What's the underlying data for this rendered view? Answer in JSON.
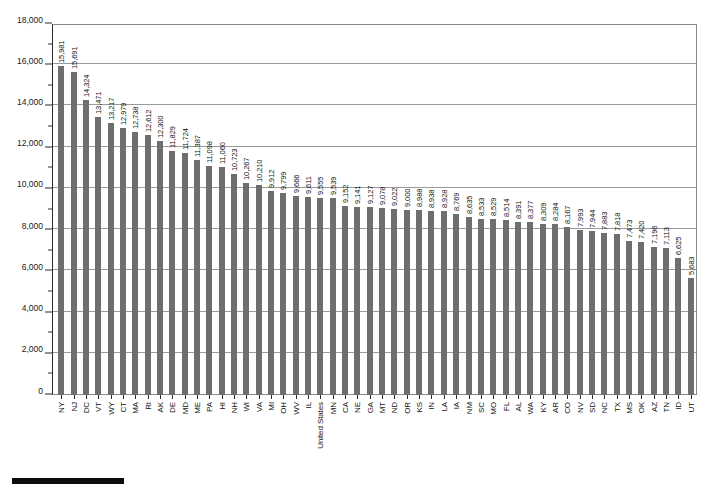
{
  "chart_data": {
    "type": "bar",
    "title": "",
    "subtitle": "",
    "xlabel": "",
    "ylabel": "",
    "ylim": [
      0,
      18000
    ],
    "ytick_step": 2000,
    "yminor_step": 1000,
    "grid": true,
    "legend_position": "bottom-left",
    "orientation": "vertical",
    "bar_color": "#6e6e6e",
    "value_labels_shown": true,
    "ytick_labels": [
      "0",
      "2,000",
      "4,000",
      "6,000",
      "8,000",
      "10,000",
      "12,000",
      "14,000",
      "16,000",
      "18,000"
    ],
    "ytick_values": [
      0,
      2000,
      4000,
      6000,
      8000,
      10000,
      12000,
      14000,
      16000,
      18000
    ],
    "categories": [
      "NY",
      "NJ",
      "DC",
      "VT",
      "WY",
      "CT",
      "MA",
      "RI",
      "AK",
      "DE",
      "MD",
      "ME",
      "PA",
      "HI",
      "NH",
      "WI",
      "VA",
      "MI",
      "OH",
      "WV",
      "IL",
      "United States",
      "MN",
      "CA",
      "NE",
      "GA",
      "MT",
      "ND",
      "OR",
      "KS",
      "IN",
      "LA",
      "IA",
      "NM",
      "SC",
      "MO",
      "FL",
      "AL",
      "WA",
      "KY",
      "AR",
      "CO",
      "NV",
      "SD",
      "NC",
      "TX",
      "MS",
      "OK",
      "AZ",
      "TN",
      "ID",
      "UT"
    ],
    "values": [
      15981,
      15691,
      14324,
      13471,
      13217,
      12979,
      12738,
      12612,
      12300,
      11829,
      11724,
      11387,
      11098,
      11060,
      10723,
      10267,
      10210,
      9912,
      9799,
      9666,
      9611,
      9555,
      9539,
      9152,
      9141,
      9127,
      9078,
      9022,
      9000,
      8988,
      8938,
      8928,
      8769,
      8635,
      8533,
      8529,
      8514,
      8391,
      8377,
      8309,
      8284,
      8167,
      7993,
      7944,
      7883,
      7818,
      7473,
      7420,
      7196,
      7113,
      6625,
      5683
    ],
    "value_labels": [
      "15,981",
      "15,691",
      "14,324",
      "13,471",
      "13,217",
      "12,979",
      "12,738",
      "12,612",
      "12,300",
      "11,829",
      "11,724",
      "11,387",
      "11,098",
      "11,060",
      "10,723",
      "10,267",
      "10,210",
      "9,912",
      "9,799",
      "9,666",
      "9,611",
      "9,555",
      "9,539",
      "9,152",
      "9,141",
      "9,127",
      "9,078",
      "9,022",
      "9,000",
      "8,988",
      "8,938",
      "8,928",
      "8,769",
      "8,635",
      "8,533",
      "8,529",
      "8,514",
      "8,391",
      "8,377",
      "8,309",
      "8,284",
      "8,167",
      "7,993",
      "7,944",
      "7,883",
      "7,818",
      "7,473",
      "7,420",
      "7,196",
      "7,113",
      "6,625",
      "5,683"
    ],
    "highlight_category": "United States",
    "legend": []
  }
}
